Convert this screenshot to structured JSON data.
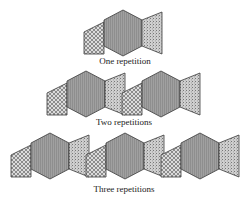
{
  "diagram": {
    "colors": {
      "outline": "#3a3a3a",
      "hexagon_fill": "#9a9a9a",
      "left_fill_bg": "#dcdcdc",
      "left_pattern": "#555555",
      "right_fill": "#c8c8c8",
      "right_speckle": "#7a7a7a"
    },
    "motif": {
      "parts": [
        "crosshatched-parallelogram",
        "gray-hexagon",
        "speckled-trapezoid"
      ]
    },
    "rows": [
      {
        "label": "One repetition",
        "count": 1,
        "x0": 84,
        "top": 10,
        "caption_y": 56
      },
      {
        "label": "Two repetitions",
        "count": 2,
        "x0": 47,
        "top": 71,
        "caption_y": 118
      },
      {
        "label": "Three repetitions",
        "count": 3,
        "x0": 11,
        "top": 133,
        "caption_y": 184
      }
    ]
  }
}
